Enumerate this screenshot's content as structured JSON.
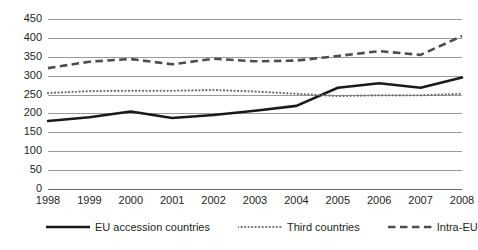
{
  "chart_data": {
    "type": "line",
    "title": "",
    "xlabel": "",
    "ylabel": "",
    "x": [
      1998,
      1999,
      2000,
      2001,
      2002,
      2003,
      2004,
      2005,
      2006,
      2007,
      2008
    ],
    "xticklabels": [
      "1998",
      "1999",
      "2000",
      "2001",
      "2002",
      "2003",
      "2004",
      "2005",
      "2006",
      "2007",
      "2008"
    ],
    "ylim": [
      0,
      450
    ],
    "yticks": [
      0,
      50,
      100,
      150,
      200,
      250,
      300,
      350,
      400,
      450
    ],
    "yticklabels": [
      "0",
      "50",
      "100",
      "150",
      "200",
      "250",
      "300",
      "350",
      "400",
      "450"
    ],
    "grid": true,
    "legend_position": "bottom",
    "series": [
      {
        "name": "EU accession countries",
        "style": "solid",
        "color": "#1a1a1a",
        "width": 2.6,
        "values": [
          180,
          190,
          205,
          188,
          196,
          207,
          220,
          268,
          280,
          268,
          295
        ]
      },
      {
        "name": "Third countries",
        "style": "dotted",
        "color": "#6f6f6f",
        "width": 2.2,
        "values": [
          254,
          259,
          260,
          260,
          262,
          258,
          252,
          246,
          248,
          248,
          252
        ]
      },
      {
        "name": "Intra-EU",
        "style": "dashed",
        "color": "#4d4d4d",
        "width": 2.6,
        "values": [
          320,
          337,
          344,
          330,
          345,
          338,
          340,
          352,
          365,
          355,
          405
        ]
      }
    ]
  },
  "legend": {
    "items": [
      {
        "label": "EU accession countries",
        "style": "solid"
      },
      {
        "label": "Third countries",
        "style": "dotted"
      },
      {
        "label": "Intra-EU",
        "style": "dashed"
      }
    ]
  }
}
